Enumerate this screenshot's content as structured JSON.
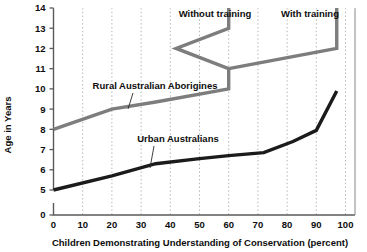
{
  "chart_data": {
    "type": "line",
    "title": "",
    "xlabel": "Children Demonstrating Understanding of Conservation (percent)",
    "ylabel": "Age in Years",
    "xlim": [
      0,
      104
    ],
    "ylim": [
      0,
      14
    ],
    "grid": "vertical-dotted",
    "legend_position": "inline-annotations",
    "x_ticks": [
      "0",
      "10",
      "20",
      "30",
      "40",
      "50",
      "60",
      "70",
      "80",
      "90",
      "100"
    ],
    "x_tick_values": [
      0,
      10,
      20,
      30,
      40,
      50,
      60,
      70,
      80,
      90,
      100
    ],
    "y_ticks": [
      "0",
      "5",
      "6",
      "7",
      "8",
      "9",
      "10",
      "11",
      "12",
      "13",
      "14"
    ],
    "y_tick_values": [
      0,
      5,
      6,
      7,
      8,
      9,
      10,
      11,
      12,
      13,
      14
    ],
    "y_axis_break": true,
    "y_axis_break_note": "Axis jumps from 0 to 5; ticks 5 through 14 are evenly spaced.",
    "series": [
      {
        "name": "Rural Australian Aborigines",
        "color": "#7d7d7d",
        "width": 3.4,
        "points": [
          [
            0,
            8.0
          ],
          [
            20,
            9.0
          ],
          [
            35,
            9.35
          ],
          [
            60,
            10.0
          ],
          [
            60,
            11.0
          ],
          [
            42,
            12.0
          ],
          [
            60,
            13.0
          ],
          [
            60,
            14.0
          ]
        ]
      },
      {
        "name": "Rural Australian Aborigines with training",
        "color": "#7d7d7d",
        "width": 3.4,
        "points": [
          [
            60,
            11.0
          ],
          [
            97,
            12.0
          ],
          [
            97,
            14.0
          ]
        ]
      },
      {
        "name": "Urban Australians",
        "color": "#1b1b1b",
        "width": 3.4,
        "points": [
          [
            0,
            5.0
          ],
          [
            20,
            5.7
          ],
          [
            35,
            6.3
          ],
          [
            50,
            6.55
          ],
          [
            60,
            6.7
          ],
          [
            72,
            6.85
          ],
          [
            82,
            7.4
          ],
          [
            90,
            7.95
          ],
          [
            97,
            9.9
          ]
        ]
      }
    ],
    "annotations": [
      {
        "name": "without-training-label",
        "text": "Without training",
        "x_px": 215,
        "y_px": 17
      },
      {
        "name": "with-training-label",
        "text": "With training",
        "x_px": 310,
        "y_px": 17
      },
      {
        "name": "rural-aborigines-label",
        "text": "Rural Australian Aborigines",
        "x_px": 155,
        "y_px": 89,
        "leader": [
          [
            133,
            93
          ],
          [
            128,
            109
          ]
        ]
      },
      {
        "name": "urban-australians-label",
        "text": "Urban Australians",
        "x_px": 178,
        "y_px": 142,
        "leader": [
          [
            154,
            146
          ],
          [
            150,
            168
          ]
        ]
      }
    ],
    "colors": {
      "rural_line": "#7d7d7d",
      "urban_line": "#1b1b1b",
      "gridline": "#b4b4b4",
      "axis": "#5a5a5a",
      "text": "#0d0d0d",
      "background": "#ffffff"
    }
  }
}
